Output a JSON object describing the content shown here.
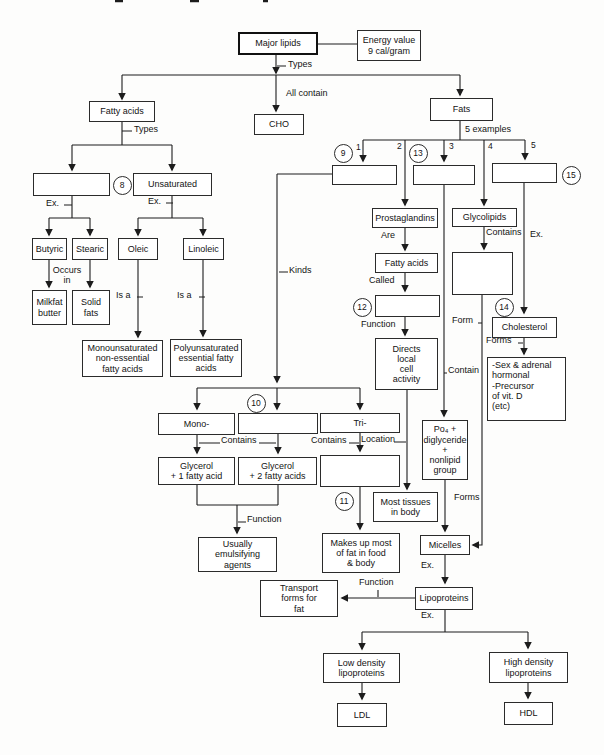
{
  "diagram": {
    "nodes": {
      "major_lipids": "Major lipids",
      "energy_value": "Energy value\n9 cal/gram",
      "cho": "CHO",
      "fatty_acids": "Fatty acids",
      "fats": "Fats",
      "saturated_blank": "",
      "unsaturated": "Unsaturated",
      "butyric": "Butyric",
      "stearic": "Stearic",
      "milkfat_butter": "Milkfat\nbutter",
      "solid_fats": "Solid\nfats",
      "oleic": "Oleic",
      "linoleic": "Linoleic",
      "monounsaturated": "Monounsaturated\nnon-essential\nfatty acids",
      "polyunsaturated": "Polyunsaturated\nessential fatty\nacids",
      "example1_blank": "",
      "example3_blank": "",
      "example5_blank": "",
      "prostaglandins": "Prostaglandins",
      "glycolipids": "Glycolipids",
      "fatty_acids_called": "Fatty acids",
      "called_blank": "",
      "directs_local": "Directs\nlocal\ncell\nactivity",
      "glycolipid_contents_blank": "",
      "cholesterol": "Cholesterol",
      "cholesterol_forms": "-Sex & adrenal\nhormonal\n-Precursor\nof vit. D\n(etc)",
      "po4_group": "Po₄ +\ndiglyceride\n+\nnonlipid\ngroup",
      "mono": "Mono-",
      "di_blank": "",
      "tri": "Tri-",
      "glycerol_1": "Glycerol\n+ 1 fatty acid",
      "glycerol_2": "Glycerol\n+ 2 fatty acids",
      "tri_contents_blank": "",
      "most_tissues": "Most tissues\nin body",
      "usually_emulsifying": "Usually\nemulsifying\nagents",
      "makes_up_most": "Makes up most\nof fat in food\n& body",
      "transport_forms": "Transport\nforms for\nfat",
      "micelles": "Micelles",
      "lipoproteins": "Lipoproteins",
      "low_density": "Low density\nlipoproteins",
      "high_density": "High density\nlipoproteins",
      "ldl": "LDL",
      "hdl": "HDL"
    },
    "edge_labels": {
      "types_top": "Types",
      "all_contain": "All contain",
      "types_fa": "Types",
      "five_examples": "5 examples",
      "ex_left": "Ex.",
      "ex_right": "Ex.",
      "occurs_in": "Occurs\nin",
      "is_a_left": "Is a",
      "is_a_right": "Is a",
      "kinds": "Kinds",
      "are": "Are",
      "called": "Called",
      "function_mid": "Function",
      "contains_1": "Contains",
      "contains_2": "Contains",
      "location": "Location",
      "contains_glyco": "Contains",
      "ex_chol": "Ex.",
      "form": "Form",
      "contain": "Contain",
      "forms_chol": "Forms",
      "forms_po4": "Forms",
      "function_emuls": "Function",
      "ex_micelles": "Ex.",
      "function_lipo": "Function",
      "ex_lipo": "Ex."
    },
    "circled_numbers": {
      "c8": "8",
      "c9": "9",
      "c10": "10",
      "c11": "11",
      "c12": "12",
      "c13": "13",
      "c14": "14",
      "c15": "15"
    },
    "branch_numbers": {
      "b1": "1",
      "b2": "2",
      "b3": "3",
      "b4": "4",
      "b5": "5"
    }
  }
}
